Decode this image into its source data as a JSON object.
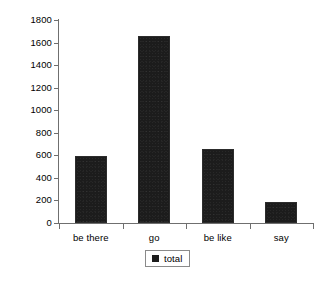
{
  "chart_data": {
    "type": "bar",
    "title": "",
    "xlabel": "",
    "ylabel": "",
    "categories": [
      "be there",
      "go",
      "be like",
      "say"
    ],
    "series": [
      {
        "name": "total",
        "values": [
          590,
          1660,
          655,
          185
        ]
      }
    ],
    "ylim": [
      0,
      1800
    ],
    "ytick_labels": [
      "0",
      "200",
      "400",
      "600",
      "800",
      "1000",
      "1200",
      "1400",
      "1600",
      "1800"
    ],
    "ytick_values": [
      0,
      200,
      400,
      600,
      800,
      1000,
      1200,
      1400,
      1600,
      1800
    ],
    "grid": false,
    "legend": {
      "position": "bottom-center",
      "entries": [
        {
          "label": "total",
          "color": "#1c1c1c"
        }
      ]
    },
    "colors": {
      "bar": "#1c1c1c",
      "axis": "#6f6f6f",
      "text": "#000000",
      "background": "#ffffff"
    }
  },
  "caption": {
    "text": ""
  }
}
